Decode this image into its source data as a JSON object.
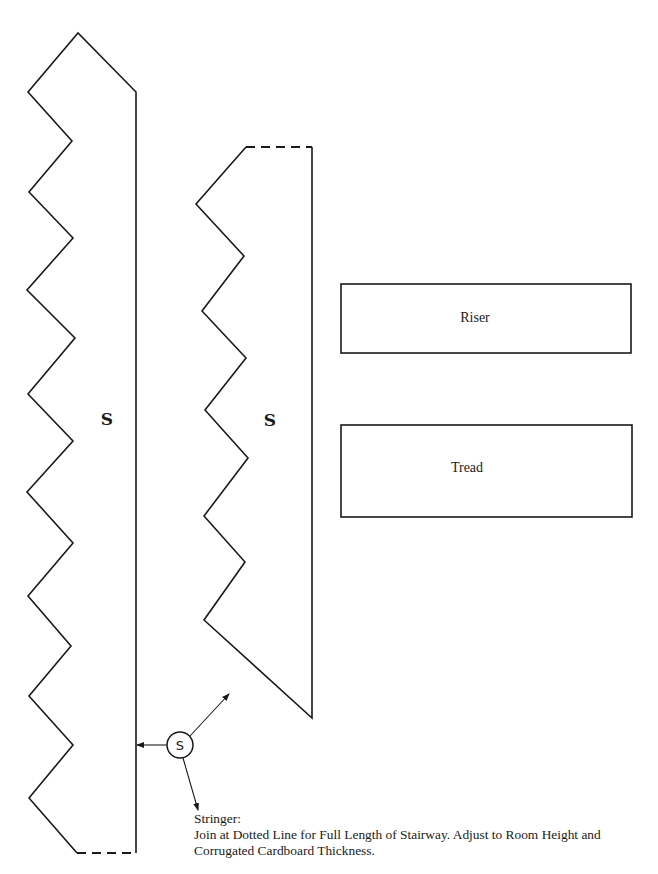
{
  "diagram": {
    "type": "cut-out pattern",
    "colors": {
      "line": "#1a1a1a",
      "background": "#ffffff"
    },
    "pieces": [
      {
        "id": "stringer-long",
        "label": "S"
      },
      {
        "id": "stringer-short",
        "label": "S"
      },
      {
        "id": "riser",
        "label": "Riser"
      },
      {
        "id": "tread",
        "label": "Tread"
      }
    ],
    "callout": {
      "symbol": "S",
      "title": "Stringer:",
      "line1": "Join at Dotted Line for Full Length of Stairway. Adjust to Room Height and",
      "line2": "Corrugated Cardboard Thickness."
    }
  }
}
